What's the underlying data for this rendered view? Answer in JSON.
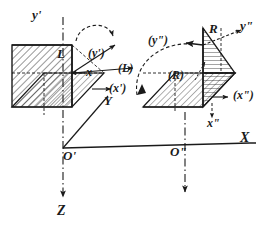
{
  "figure": {
    "ink_color": "#1a1a1a",
    "background_color": "#ffffff",
    "global_axes": [
      {
        "name": "X",
        "label": "X",
        "direction": "right"
      },
      {
        "name": "Y",
        "label": "Y",
        "direction": "upper-right-oblique"
      },
      {
        "name": "Z",
        "label": "Z",
        "direction": "down"
      }
    ],
    "origins": [
      {
        "name": "origin-left",
        "label": "O'"
      },
      {
        "name": "origin-right",
        "label": "O\""
      }
    ],
    "left_frame": {
      "body_label": "L",
      "axis_labels": [
        {
          "name": "y-prime-axis",
          "label": "y'"
        },
        {
          "name": "x-axis",
          "label": "x"
        },
        {
          "name": "y-prime-paren",
          "label": "(y')"
        },
        {
          "name": "x-prime-paren",
          "label": "(x')"
        },
        {
          "name": "l-paren",
          "label": "(L)"
        }
      ]
    },
    "right_frame": {
      "body_label": "R",
      "axis_labels": [
        {
          "name": "y-double-prime-axis",
          "label": "y\""
        },
        {
          "name": "x-double-prime-axis",
          "label": "x\""
        },
        {
          "name": "y-double-prime-paren",
          "label": "(y\")"
        },
        {
          "name": "x-double-prime-paren",
          "label": "(x\")"
        },
        {
          "name": "r-paren",
          "label": "(R)"
        }
      ]
    }
  }
}
